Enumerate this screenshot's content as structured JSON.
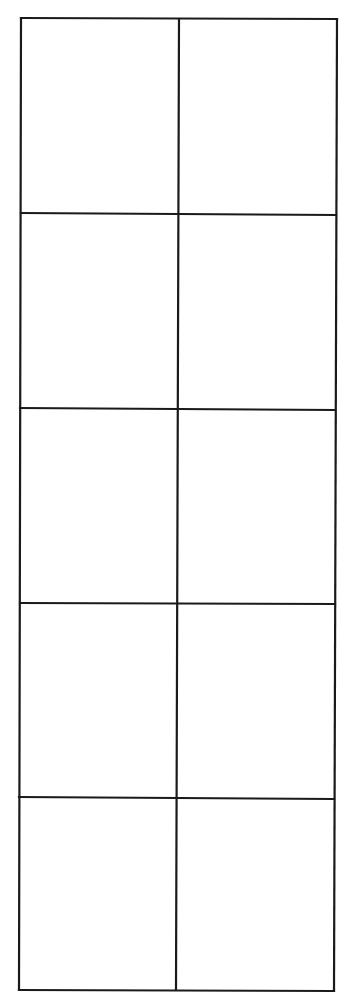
{
  "grid": {
    "rows": 5,
    "columns": 2,
    "line_color": "#1a1a1a",
    "background": "#ffffff",
    "cells": [
      [
        "",
        ""
      ],
      [
        "",
        ""
      ],
      [
        "",
        ""
      ],
      [
        "",
        ""
      ],
      [
        "",
        ""
      ]
    ]
  }
}
